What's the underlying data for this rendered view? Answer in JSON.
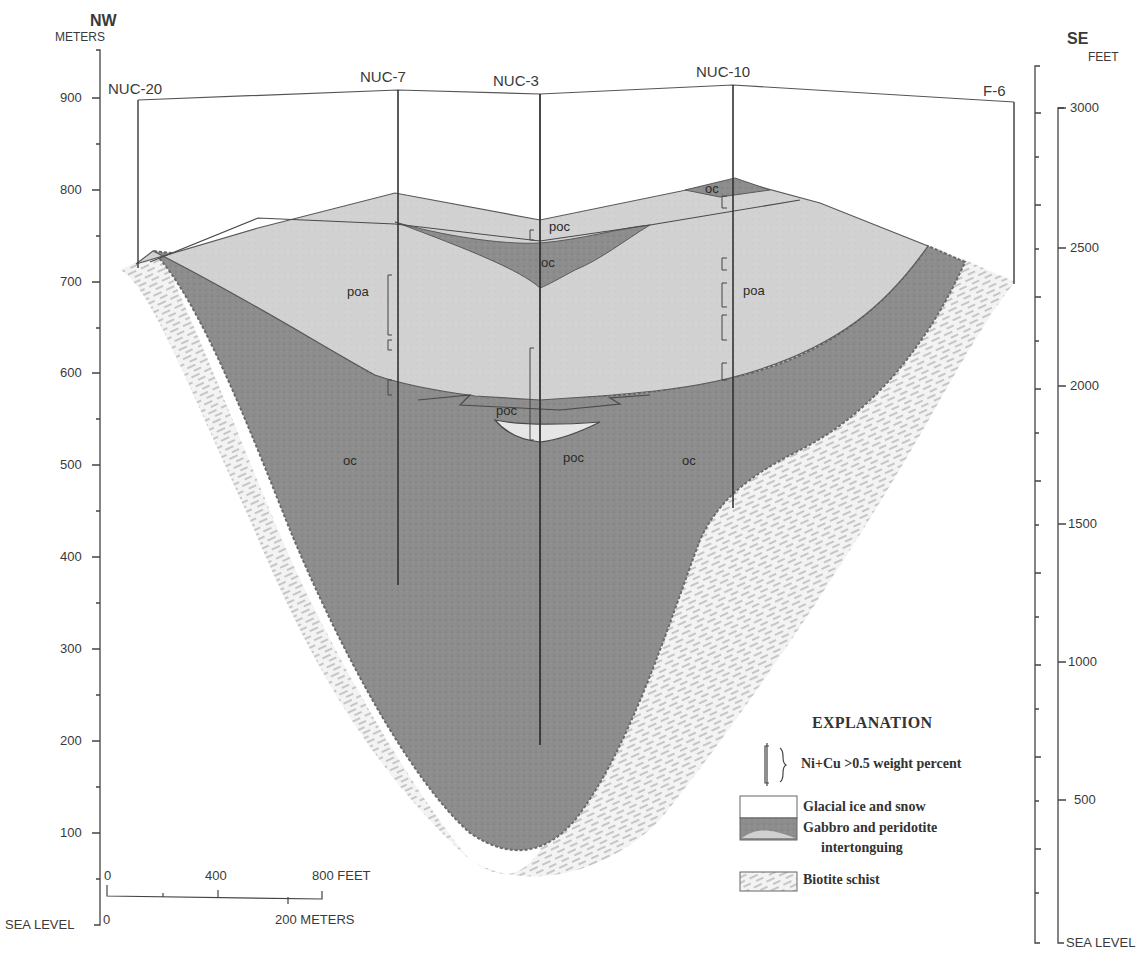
{
  "diagram": {
    "type": "geologic cross-section",
    "orientation": {
      "left": "NW",
      "right": "SE"
    },
    "left_axis": {
      "unit": "METERS",
      "ticks": [
        "900",
        "800",
        "700",
        "600",
        "500",
        "400",
        "300",
        "200",
        "100",
        "SEA LEVEL"
      ]
    },
    "right_axis": {
      "unit": "FEET",
      "ticks": [
        "3000",
        "2500",
        "2000",
        "1500",
        "1000",
        "500",
        "SEA LEVEL"
      ]
    },
    "drill_holes": [
      {
        "id": "NUC-20"
      },
      {
        "id": "NUC-7"
      },
      {
        "id": "NUC-3"
      },
      {
        "id": "NUC-10"
      },
      {
        "id": "F-6"
      }
    ],
    "unit_labels": {
      "poc_upper": "poc",
      "oc_upper": "oc",
      "oc_right_top": "oc",
      "poa_left": "poa",
      "poa_right": "poa",
      "poc_middle": "poc",
      "poc_lower": "poc",
      "oc_left": "oc",
      "oc_right": "oc"
    },
    "scale_bar": {
      "feet_ticks": [
        "0",
        "400",
        "800 FEET"
      ],
      "meter_ticks": [
        "0",
        "200 METERS"
      ]
    }
  },
  "legend": {
    "title": "EXPLANATION",
    "items": [
      {
        "symbol": "bracket-symbol",
        "label": "Ni+Cu >0.5 weight percent"
      },
      {
        "symbol": "ice-swatch",
        "label": "Glacial ice and snow",
        "color": "#ffffff"
      },
      {
        "symbol": "gabbro-swatch",
        "label": "Gabbro and peridotite",
        "label2": "intertonguing",
        "color": "#8a8a8a"
      },
      {
        "symbol": "schist-swatch",
        "label": "Biotite schist",
        "color": "#e6e6e6"
      }
    ]
  },
  "colors": {
    "peridotite_light": "#cfcfcf",
    "gabbro_dark": "#8c8c8c",
    "schist": "#ececec",
    "line": "#3a3a3a"
  }
}
